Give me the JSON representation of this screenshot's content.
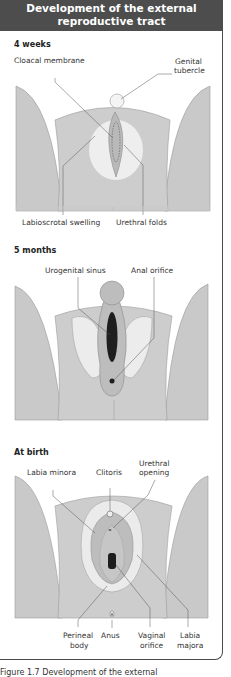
{
  "header": {
    "title_line1": "Development of the external",
    "title_line2": "reproductive tract"
  },
  "stages": [
    {
      "title": "4 weeks",
      "labels": {
        "cloacal_membrane": "Cloacal membrane",
        "genital_tubercle_1": "Genital",
        "genital_tubercle_2": "tubercle",
        "labioscrotal_swelling": "Labioscrotal swelling",
        "urethral_folds": "Urethral folds"
      }
    },
    {
      "title": "5 months",
      "labels": {
        "urogenital_sinus": "Urogenital sinus",
        "anal_orifice": "Anal orifice"
      }
    },
    {
      "title": "At birth",
      "labels": {
        "labia_minora": "Labia minora",
        "clitoris": "Clitoris",
        "urethral_opening_1": "Urethral",
        "urethral_opening_2": "opening",
        "perineal_body_1": "Perineal",
        "perineal_body_2": "body",
        "anus": "Anus",
        "vaginal_orifice_1": "Vaginal",
        "vaginal_orifice_2": "orifice",
        "labia_majora_1": "Labia",
        "labia_majora_2": "majora"
      }
    }
  ],
  "caption": "Figure 1.7 Development of the external",
  "colors": {
    "header_bg": "#4d4d4d",
    "tissue": "#c8c8c8",
    "light_tissue": "#e6e6e6",
    "dark": "#1e1e1e"
  }
}
